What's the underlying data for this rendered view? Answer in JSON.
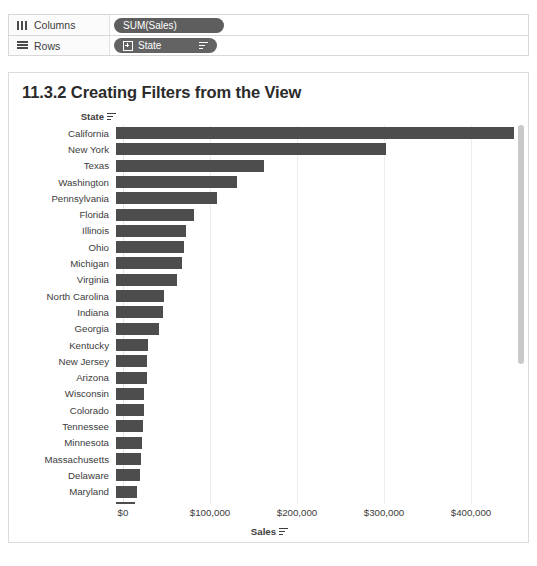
{
  "shelves": [
    {
      "name": "columns",
      "label": "Columns",
      "icon": "columns-icon",
      "pill": {
        "label": "SUM(Sales)",
        "type": "measure",
        "has_sort_icon": false,
        "has_expand_icon": false
      }
    },
    {
      "name": "rows",
      "label": "Rows",
      "icon": "rows-icon",
      "pill": {
        "label": "State",
        "type": "dimension",
        "has_sort_icon": true,
        "has_expand_icon": true
      }
    }
  ],
  "viz": {
    "title": "11.3.2 Creating Filters from the View",
    "row_header": "State",
    "row_header_sort_icon": "sort-descending-icon",
    "axis_title": "Sales",
    "axis_title_sort_icon": "sort-descending-icon"
  },
  "chart_data": {
    "type": "bar",
    "orientation": "horizontal",
    "title": "11.3.2 Creating Filters from the View",
    "xlabel": "Sales",
    "ylabel": "State",
    "xlim": [
      0,
      460000
    ],
    "grid": true,
    "legend": null,
    "tick_labels": [
      "$0",
      "$100,000",
      "$200,000",
      "$300,000",
      "$400,000"
    ],
    "tick_values": [
      0,
      100000,
      200000,
      300000,
      400000
    ],
    "bar_color": "#4d4d4d",
    "categories": [
      "California",
      "New York",
      "Texas",
      "Washington",
      "Pennsylvania",
      "Florida",
      "Illinois",
      "Ohio",
      "Michigan",
      "Virginia",
      "North Carolina",
      "Indiana",
      "Georgia",
      "Kentucky",
      "New Jersey",
      "Arizona",
      "Wisconsin",
      "Colorado",
      "Tennessee",
      "Minnesota",
      "Massachusetts",
      "Delaware",
      "Maryland"
    ],
    "values": [
      457688,
      310876,
      170188,
      138641,
      116512,
      89474,
      80166,
      78258,
      76270,
      70637,
      55604,
      53555,
      49095,
      36592,
      35402,
      35283,
      32115,
      32108,
      30662,
      29863,
      28634,
      27451,
      23706
    ]
  },
  "scrollbar": {
    "name": "vertical-scrollbar",
    "thumb_position_pct": 0,
    "thumb_size_pct": 63
  }
}
